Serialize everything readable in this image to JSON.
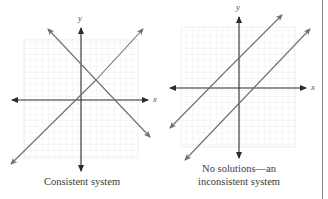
{
  "figures": [
    {
      "id": "consistent",
      "caption_lines": [
        "Consistent system"
      ],
      "axis_labels": {
        "x": "x",
        "y": "y"
      },
      "lines": [
        {
          "name": "line-1",
          "slope": "negative"
        },
        {
          "name": "line-2",
          "slope": "positive"
        }
      ],
      "intersection": "single point (one solution)"
    },
    {
      "id": "inconsistent",
      "caption_lines": [
        "No solutions—an",
        "inconsistent system"
      ],
      "axis_labels": {
        "x": "x",
        "y": "y"
      },
      "lines": [
        {
          "name": "line-a",
          "slope": "positive"
        },
        {
          "name": "line-b",
          "slope": "positive"
        }
      ],
      "intersection": "none (parallel lines)"
    }
  ],
  "colors": {
    "axis": "#2a2a2a",
    "line": "#6e6e6e",
    "grid": "#e6e6e6",
    "text": "#3a3a3a",
    "border": "#8a8a8a"
  }
}
